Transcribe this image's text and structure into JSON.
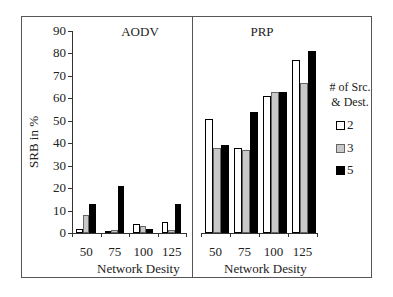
{
  "chart_data": [
    {
      "type": "bar",
      "title": "AODV",
      "xlabel": "Network Desity",
      "ylabel": "SRB in %",
      "categories": [
        "50",
        "75",
        "100",
        "125"
      ],
      "ylim": [
        0,
        90
      ],
      "yticks": [
        0,
        10,
        20,
        30,
        40,
        50,
        60,
        70,
        80,
        90
      ],
      "grid": false,
      "series": [
        {
          "name": "2",
          "values": [
            2,
            1,
            4,
            5
          ]
        },
        {
          "name": "3",
          "values": [
            8,
            1.5,
            3,
            1.5
          ]
        },
        {
          "name": "5",
          "values": [
            13,
            21,
            2,
            13
          ]
        }
      ]
    },
    {
      "type": "bar",
      "title": "PRP",
      "xlabel": "Network Desity",
      "ylabel": "SRB in %",
      "categories": [
        "50",
        "75",
        "100",
        "125"
      ],
      "ylim": [
        0,
        90
      ],
      "grid": false,
      "series": [
        {
          "name": "2",
          "values": [
            51,
            38,
            61,
            77
          ]
        },
        {
          "name": "3",
          "values": [
            38,
            37,
            63,
            67
          ]
        },
        {
          "name": "5",
          "values": [
            39,
            54,
            63,
            81
          ]
        }
      ]
    }
  ],
  "legend": {
    "title_line1": "# of Src.",
    "title_line2": "& Dest.",
    "position": "right",
    "items": [
      {
        "label": "2",
        "color": "#ffffff"
      },
      {
        "label": "3",
        "color": "#c8c8c8"
      },
      {
        "label": "5",
        "color": "#000000"
      }
    ]
  },
  "series_colors": [
    "#ffffff",
    "#c8c8c8",
    "#000000"
  ],
  "ylabel": "SRB in %",
  "panels": [
    {
      "title": "AODV",
      "xlabel": "Network Desity"
    },
    {
      "title": "PRP",
      "xlabel": "Network Desity"
    }
  ],
  "yticks": [
    "90",
    "80",
    "70",
    "60",
    "50",
    "40",
    "30",
    "20",
    "10",
    "0"
  ],
  "categories": [
    "50",
    "75",
    "100",
    "125"
  ]
}
